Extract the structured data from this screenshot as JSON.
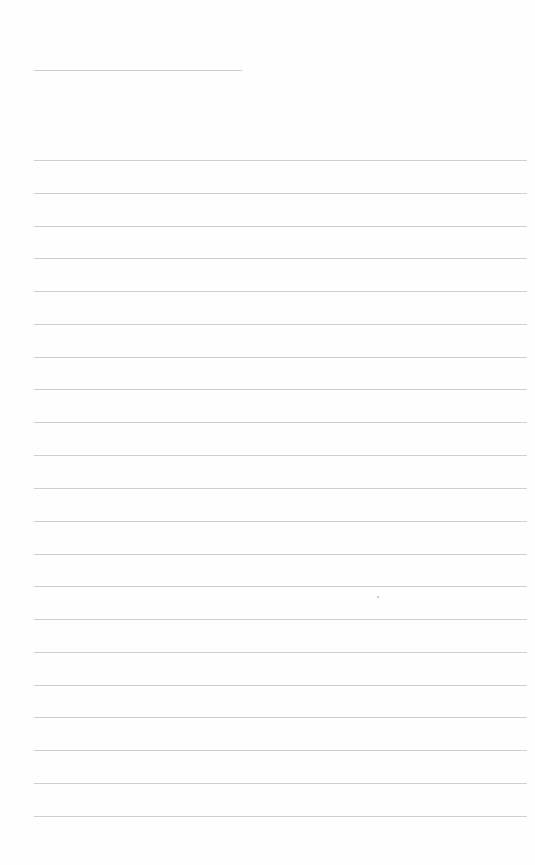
{
  "page": {
    "type": "lined-paper",
    "background_color": "#fefefe",
    "line_color": "#cfcfcf",
    "title_line": {
      "x": 34,
      "y": 70,
      "width": 208
    },
    "rules": {
      "x": 34,
      "width": 493,
      "y_positions": [
        160,
        193,
        226,
        258,
        291,
        324,
        357,
        389,
        422,
        455,
        488,
        521,
        554,
        586,
        619,
        652,
        685,
        717,
        750,
        783,
        816
      ]
    },
    "text": []
  }
}
